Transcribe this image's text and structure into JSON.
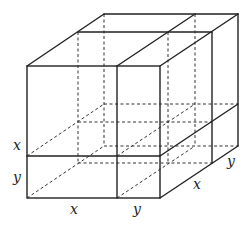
{
  "diagram": {
    "title": "",
    "colors": {
      "line": "#222222",
      "background": "#ffffff"
    },
    "labels": {
      "left_upper": "x",
      "left_lower": "y",
      "bottom_left": "x",
      "bottom_right": "y",
      "depth_front": "x",
      "depth_back": "y"
    }
  }
}
